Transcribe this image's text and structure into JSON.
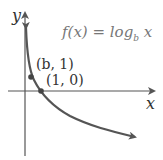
{
  "diagram": {
    "function_label": {
      "prefix": "f(x) = log",
      "base": "b",
      "suffix": " x"
    },
    "axes": {
      "x_label": "x",
      "y_label": "y"
    },
    "points": [
      {
        "label": "(b, 1)",
        "x": 31,
        "y": 77
      },
      {
        "label": "(1, 0)",
        "x": 41,
        "y": 91
      }
    ],
    "colors": {
      "curve": "#555555",
      "axis": "#555555",
      "function_text": "#777777",
      "label_text": "#333333"
    }
  }
}
